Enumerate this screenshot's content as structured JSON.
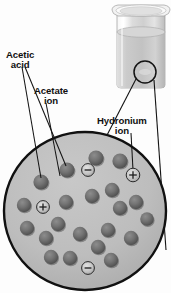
{
  "figure": {
    "background_color": "#fdfdfd"
  },
  "labels": [
    {
      "id": "acetic-acid",
      "line1": "Acetic",
      "line2": "acid",
      "x": 6,
      "y": 50
    },
    {
      "id": "acetate-ion",
      "line1": "Acetate",
      "line2": "ion",
      "x": 34,
      "y": 86
    },
    {
      "id": "hydronium-ion",
      "line1": "Hydronium",
      "line2": "ion",
      "x": 97,
      "y": 116
    }
  ],
  "beaker": {
    "name": "beaker-with-solution",
    "x": 111,
    "y": 4,
    "width": 58,
    "height": 84,
    "glass_color": "#e9e9e9",
    "liquid_color": "#c9c9c9",
    "rim_color": "#f4f4f4",
    "callout_circle": {
      "cx": 145,
      "cy": 72,
      "r": 11
    }
  },
  "magnified_view": {
    "name": "magnified-solution-circle",
    "cx": 85,
    "cy": 211,
    "rx": 81,
    "ry": 79,
    "fill_color": "#bdbdbd",
    "stroke_color": "#111111",
    "stroke_width": 2.4
  },
  "callout_lines": [
    {
      "from": [
        154,
        84
      ],
      "to": [
        166,
        250
      ],
      "name": "callout-line-right"
    },
    {
      "from": [
        136,
        79
      ],
      "to": [
        89,
        170
      ],
      "name": "callout-line-left"
    }
  ],
  "leader_lines": [
    {
      "from": [
        22,
        66
      ],
      "to": [
        41,
        179
      ],
      "name": "leader-acetic-acid-1"
    },
    {
      "from": [
        24,
        66
      ],
      "to": [
        67,
        167
      ],
      "name": "leader-acetic-acid-2"
    },
    {
      "from": [
        47,
        104
      ],
      "to": [
        59,
        177
      ],
      "name": "leader-acetate-a"
    },
    {
      "from": [
        131,
        133
      ],
      "to": [
        133,
        171
      ],
      "name": "leader-hydronium"
    }
  ],
  "particles": {
    "acetic_acid_color": "#6e6e6e",
    "acetic_acid_shadow": "#4a4a4a",
    "ion_color": "#c4c4c4",
    "ion_stroke": "#2a2a2a",
    "molecules": [
      {
        "x": 41,
        "y": 182,
        "r": 7.6,
        "type": "acetic-acid"
      },
      {
        "x": 67,
        "y": 170,
        "r": 7.6,
        "type": "acetic-acid"
      },
      {
        "x": 96,
        "y": 158,
        "r": 7.6,
        "type": "acetic-acid"
      },
      {
        "x": 120,
        "y": 161,
        "r": 7.6,
        "type": "acetic-acid"
      },
      {
        "x": 24,
        "y": 205,
        "r": 7.2,
        "type": "acetic-acid"
      },
      {
        "x": 66,
        "y": 202,
        "r": 7.2,
        "type": "acetic-acid"
      },
      {
        "x": 92,
        "y": 196,
        "r": 7.2,
        "type": "acetic-acid"
      },
      {
        "x": 112,
        "y": 190,
        "r": 7.2,
        "type": "acetic-acid"
      },
      {
        "x": 136,
        "y": 202,
        "r": 7.2,
        "type": "acetic-acid"
      },
      {
        "x": 120,
        "y": 208,
        "r": 7.2,
        "type": "acetic-acid"
      },
      {
        "x": 27,
        "y": 228,
        "r": 7.2,
        "type": "acetic-acid"
      },
      {
        "x": 58,
        "y": 224,
        "r": 7.2,
        "type": "acetic-acid"
      },
      {
        "x": 46,
        "y": 238,
        "r": 7.2,
        "type": "acetic-acid"
      },
      {
        "x": 80,
        "y": 234,
        "r": 7.2,
        "type": "acetic-acid"
      },
      {
        "x": 108,
        "y": 230,
        "r": 7.2,
        "type": "acetic-acid"
      },
      {
        "x": 131,
        "y": 238,
        "r": 7.2,
        "type": "acetic-acid"
      },
      {
        "x": 98,
        "y": 247,
        "r": 7.2,
        "type": "acetic-acid"
      },
      {
        "x": 51,
        "y": 257,
        "r": 7.2,
        "type": "acetic-acid"
      },
      {
        "x": 70,
        "y": 258,
        "r": 7.2,
        "type": "acetic-acid"
      },
      {
        "x": 111,
        "y": 260,
        "r": 7.2,
        "type": "acetic-acid"
      },
      {
        "x": 147,
        "y": 219,
        "r": 6.8,
        "type": "acetic-acid"
      }
    ],
    "ions": [
      {
        "x": 88,
        "y": 170,
        "r": 6.4,
        "charge": "−",
        "type": "acetate-ion"
      },
      {
        "x": 133,
        "y": 175,
        "r": 6.8,
        "charge": "+",
        "type": "hydronium-ion"
      },
      {
        "x": 43,
        "y": 207,
        "r": 6.4,
        "charge": "+",
        "type": "hydronium-ion"
      },
      {
        "x": 88,
        "y": 268,
        "r": 6.4,
        "charge": "−",
        "type": "acetate-ion"
      }
    ]
  }
}
